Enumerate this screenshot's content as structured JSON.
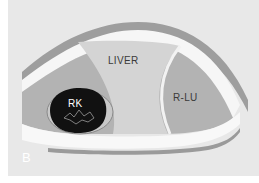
{
  "diagram": {
    "panel_label": "B",
    "labels": {
      "liver": "LIVER",
      "right_lung": "R-LU",
      "right_kidney": "RK"
    },
    "colors": {
      "background": "#e8e8e8",
      "liver_fill": "#d3d3d3",
      "posterior_fill": "#b0b0b0",
      "lung_fill": "#a8a8a8",
      "diaphragm_band": "#f4f4f4",
      "outer_band": "#9e9e9e",
      "kidney_fill": "#111111",
      "border": "#ffffff"
    }
  }
}
